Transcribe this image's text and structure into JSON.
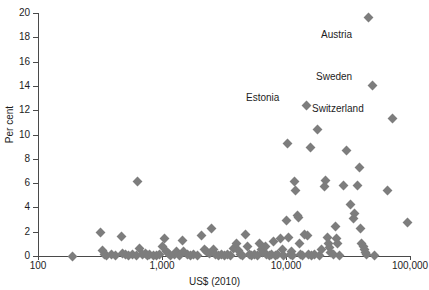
{
  "chart_data": {
    "type": "scatter",
    "title": "",
    "xlabel": "US$ (2010)",
    "ylabel": "Per cent",
    "xscale": "log",
    "xlim": [
      100,
      100000
    ],
    "ylim": [
      0,
      20
    ],
    "xticks": [
      "100",
      "1,000",
      "10,000",
      "100,000"
    ],
    "xtick_values": [
      100,
      1000,
      10000,
      100000
    ],
    "yticks": [
      "0",
      "2",
      "4",
      "6",
      "8",
      "10",
      "12",
      "14",
      "16",
      "18",
      "20"
    ],
    "ytick_values": [
      0,
      2,
      4,
      6,
      8,
      10,
      12,
      14,
      16,
      18,
      20
    ],
    "grid": false,
    "legend": "none",
    "marker": "diamond",
    "marker_color": "#7d7d7d",
    "axis_color": "#4a4a4a",
    "series": [
      {
        "name": "countries",
        "points": [
          [
            190,
            0.0
          ],
          [
            320,
            1.9
          ],
          [
            330,
            0.45
          ],
          [
            345,
            0.15
          ],
          [
            360,
            0.05
          ],
          [
            390,
            0.1
          ],
          [
            420,
            0.05
          ],
          [
            470,
            1.6
          ],
          [
            480,
            0.2
          ],
          [
            505,
            0.1
          ],
          [
            540,
            0.05
          ],
          [
            575,
            0.1
          ],
          [
            620,
            0.05
          ],
          [
            640,
            6.1
          ],
          [
            660,
            0.65
          ],
          [
            690,
            0.15
          ],
          [
            730,
            0.2
          ],
          [
            760,
            0.05
          ],
          [
            800,
            0.1
          ],
          [
            860,
            0.05
          ],
          [
            900,
            0.05
          ],
          [
            960,
            0.1
          ],
          [
            1000,
            0.8
          ],
          [
            1050,
            1.45
          ],
          [
            1080,
            0.35
          ],
          [
            1120,
            0.2
          ],
          [
            1180,
            0.05
          ],
          [
            1250,
            0.1
          ],
          [
            1300,
            0.4
          ],
          [
            1380,
            0.05
          ],
          [
            1450,
            1.25
          ],
          [
            1500,
            0.35
          ],
          [
            1600,
            0.1
          ],
          [
            1700,
            0.05
          ],
          [
            1800,
            0.15
          ],
          [
            1950,
            0.05
          ],
          [
            2100,
            1.65
          ],
          [
            2200,
            0.55
          ],
          [
            2300,
            0.4
          ],
          [
            2400,
            0.2
          ],
          [
            2500,
            2.3
          ],
          [
            2600,
            0.5
          ],
          [
            2700,
            0.1
          ],
          [
            2850,
            0.05
          ],
          [
            3000,
            0.15
          ],
          [
            3200,
            0.05
          ],
          [
            3400,
            0.1
          ],
          [
            3600,
            0.05
          ],
          [
            3800,
            0.6
          ],
          [
            4000,
            1.05
          ],
          [
            4150,
            0.45
          ],
          [
            4300,
            0.1
          ],
          [
            4500,
            0.05
          ],
          [
            4700,
            1.8
          ],
          [
            4900,
            0.8
          ],
          [
            5100,
            0.15
          ],
          [
            5300,
            0.05
          ],
          [
            5600,
            0.1
          ],
          [
            5900,
            0.05
          ],
          [
            6100,
            1.0
          ],
          [
            6300,
            0.55
          ],
          [
            6500,
            0.3
          ],
          [
            6800,
            0.75
          ],
          [
            7000,
            0.1
          ],
          [
            7300,
            0.05
          ],
          [
            7600,
            0.15
          ],
          [
            7900,
            1.2
          ],
          [
            8200,
            0.05
          ],
          [
            8600,
            0.1
          ],
          [
            9000,
            1.45
          ],
          [
            9300,
            0.55
          ],
          [
            9600,
            0.05
          ],
          [
            10000,
            2.9
          ],
          [
            10200,
            9.3
          ],
          [
            10500,
            1.55
          ],
          [
            10800,
            0.1
          ],
          [
            11000,
            0.35
          ],
          [
            11300,
            0.05
          ],
          [
            11800,
            6.15
          ],
          [
            12000,
            5.35
          ],
          [
            12300,
            3.3
          ],
          [
            12600,
            3.15
          ],
          [
            12900,
            1.0
          ],
          [
            13200,
            0.1
          ],
          [
            13600,
            0.05
          ],
          [
            14000,
            1.75
          ],
          [
            14500,
            12.4
          ],
          [
            14900,
            1.7
          ],
          [
            15300,
            0.15
          ],
          [
            15800,
            8.9
          ],
          [
            16200,
            0.05
          ],
          [
            17000,
            0.1
          ],
          [
            17800,
            10.45
          ],
          [
            18500,
            0.05
          ],
          [
            19500,
            0.5
          ],
          [
            20500,
            5.75
          ],
          [
            21000,
            6.2
          ],
          [
            21500,
            1.55
          ],
          [
            22000,
            1.0
          ],
          [
            22500,
            0.7
          ],
          [
            23000,
            0.25
          ],
          [
            24000,
            0.1
          ],
          [
            25000,
            2.4
          ],
          [
            25500,
            1.45
          ],
          [
            26000,
            1.0
          ],
          [
            27000,
            0.05
          ],
          [
            29000,
            5.8
          ],
          [
            31000,
            8.65
          ],
          [
            33000,
            4.2
          ],
          [
            35000,
            3.05
          ],
          [
            36000,
            3.5
          ],
          [
            38000,
            5.8
          ],
          [
            39000,
            7.3
          ],
          [
            40000,
            2.3
          ],
          [
            41000,
            1.0
          ],
          [
            42000,
            0.75
          ],
          [
            43000,
            0.55
          ],
          [
            44000,
            0.3
          ],
          [
            45000,
            0.1
          ],
          [
            46000,
            19.6
          ],
          [
            50000,
            14.0
          ],
          [
            52000,
            0.05
          ],
          [
            66000,
            5.4
          ],
          [
            72000,
            11.3
          ],
          [
            95000,
            2.75
          ]
        ]
      }
    ],
    "annotations": [
      {
        "text": "Austria",
        "x_px": 321,
        "y_px": 29
      },
      {
        "text": "Sweden",
        "x_px": 316,
        "y_px": 71
      },
      {
        "text": "Estonia",
        "x_px": 246,
        "y_px": 92
      },
      {
        "text": "Switzerland",
        "x_px": 312,
        "y_px": 103
      }
    ]
  }
}
